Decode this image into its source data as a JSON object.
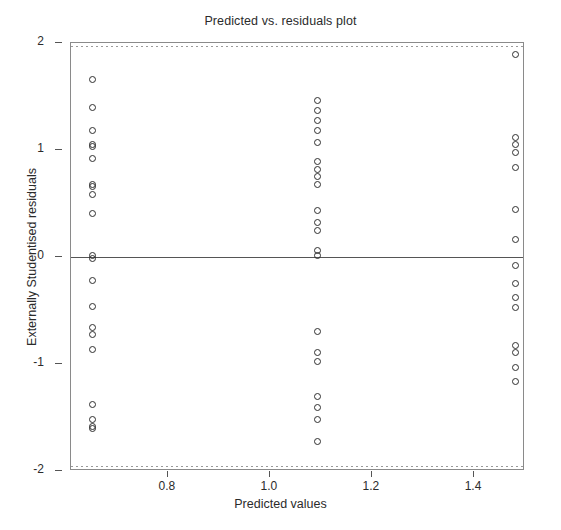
{
  "chart_data": {
    "type": "scatter",
    "title": "Predicted vs. residuals plot",
    "xlabel": "Predicted values",
    "ylabel": "Externally Studentised residuals",
    "xlim": [
      0.61,
      1.5
    ],
    "ylim": [
      -2,
      2
    ],
    "xticks": [
      0.8,
      1.0,
      1.2,
      1.4
    ],
    "xtick_labels": [
      "0.8",
      "1.0",
      "1.2",
      "1.4"
    ],
    "yticks": [
      2,
      1,
      0,
      -1,
      -2
    ],
    "ytick_labels": [
      "2",
      "1",
      "0",
      "-1",
      "-2"
    ],
    "grid": false,
    "reference_line_y": 0,
    "legend": null,
    "marker": "open-circle",
    "series": [
      {
        "name": "residuals",
        "points": [
          [
            0.653,
            1.66
          ],
          [
            0.653,
            1.4
          ],
          [
            0.653,
            1.18
          ],
          [
            0.653,
            1.05
          ],
          [
            0.653,
            1.03
          ],
          [
            0.653,
            0.92
          ],
          [
            0.653,
            0.68
          ],
          [
            0.653,
            0.66
          ],
          [
            0.653,
            0.58
          ],
          [
            0.653,
            0.41
          ],
          [
            0.653,
            0.01
          ],
          [
            0.653,
            -0.01
          ],
          [
            0.653,
            -0.22
          ],
          [
            0.653,
            -0.46
          ],
          [
            0.653,
            -0.66
          ],
          [
            0.653,
            -0.72
          ],
          [
            0.653,
            -0.86
          ],
          [
            0.653,
            -1.38
          ],
          [
            0.653,
            -1.52
          ],
          [
            0.653,
            -1.58
          ],
          [
            0.653,
            -1.6
          ],
          [
            1.093,
            1.46
          ],
          [
            1.093,
            1.37
          ],
          [
            1.093,
            1.28
          ],
          [
            1.093,
            1.18
          ],
          [
            1.093,
            1.07
          ],
          [
            1.093,
            0.89
          ],
          [
            1.093,
            0.82
          ],
          [
            1.093,
            0.75
          ],
          [
            1.093,
            0.68
          ],
          [
            1.093,
            0.43
          ],
          [
            1.093,
            0.32
          ],
          [
            1.093,
            0.25
          ],
          [
            1.093,
            0.06
          ],
          [
            1.093,
            0.01
          ],
          [
            1.093,
            -0.7
          ],
          [
            1.093,
            -0.89
          ],
          [
            1.093,
            -0.98
          ],
          [
            1.093,
            -1.3
          ],
          [
            1.093,
            -1.41
          ],
          [
            1.093,
            -1.52
          ],
          [
            1.093,
            -1.72
          ],
          [
            1.481,
            1.89
          ],
          [
            1.481,
            1.12
          ],
          [
            1.481,
            1.05
          ],
          [
            1.481,
            0.98
          ],
          [
            1.481,
            0.84
          ],
          [
            1.481,
            0.44
          ],
          [
            1.481,
            0.16
          ],
          [
            1.481,
            -0.08
          ],
          [
            1.481,
            -0.25
          ],
          [
            1.481,
            -0.38
          ],
          [
            1.481,
            -0.47
          ],
          [
            1.481,
            -0.83
          ],
          [
            1.481,
            -0.89
          ],
          [
            1.481,
            -1.03
          ],
          [
            1.481,
            -1.16
          ]
        ]
      }
    ]
  }
}
